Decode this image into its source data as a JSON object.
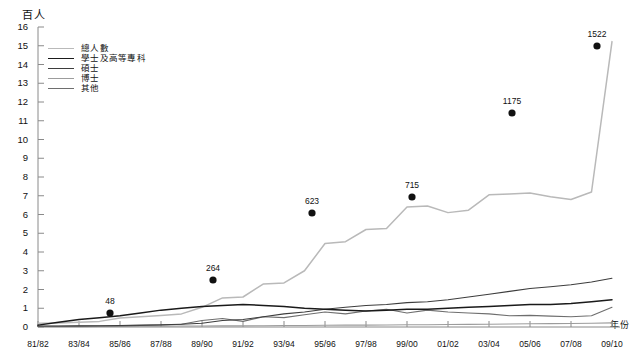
{
  "axes": {
    "y_unit_label": "百人",
    "x_axis_title": "年份",
    "y_ticks": [
      "16",
      "15",
      "14",
      "13",
      "12",
      "11",
      "10",
      "9",
      "8",
      "7",
      "6",
      "5",
      "4",
      "3",
      "2",
      "1",
      "0"
    ],
    "x_ticks": [
      "81/82",
      "83/84",
      "85/86",
      "87/88",
      "89/90",
      "91/92",
      "93/94",
      "95/96",
      "97/98",
      "99/00",
      "01/02",
      "03/04",
      "05/06",
      "07/08",
      "09/10"
    ]
  },
  "legend": {
    "items": [
      {
        "label": "總人數",
        "color": "#b9b9b9"
      },
      {
        "label": "學士及高等專科",
        "color": "#1a1a1a"
      },
      {
        "label": "碩士",
        "color": "#3d3d3d"
      },
      {
        "label": "博士",
        "color": "#9c9c9c"
      },
      {
        "label": "其他",
        "color": "#6e6e6e"
      }
    ]
  },
  "annotations": [
    {
      "label": "48",
      "x_px": 110,
      "y_px": 313,
      "dot_x": 110,
      "dot_y": 313
    },
    {
      "label": "264",
      "x_px": 213,
      "y_px": 280,
      "dot_x": 213,
      "dot_y": 280
    },
    {
      "label": "623",
      "x_px": 312,
      "y_px": 213,
      "dot_x": 312,
      "dot_y": 213
    },
    {
      "label": "715",
      "x_px": 412,
      "y_px": 197,
      "dot_x": 412,
      "dot_y": 197
    },
    {
      "label": "1175",
      "x_px": 512,
      "y_px": 113,
      "dot_x": 512,
      "dot_y": 113
    },
    {
      "label": "1522",
      "x_px": 597,
      "y_px": 46,
      "dot_x": 597,
      "dot_y": 46
    }
  ],
  "chart_data": {
    "type": "line",
    "title": "",
    "xlabel": "年份",
    "ylabel": "百人",
    "ylim": [
      0,
      16
    ],
    "grid": false,
    "legend_position": "top-left",
    "x": [
      "81/82",
      "82/83",
      "83/84",
      "84/85",
      "85/86",
      "86/87",
      "87/88",
      "88/89",
      "89/90",
      "90/91",
      "91/92",
      "92/93",
      "93/94",
      "94/95",
      "95/96",
      "96/97",
      "97/98",
      "98/99",
      "99/00",
      "00/01",
      "01/02",
      "02/03",
      "03/04",
      "04/05",
      "05/06",
      "06/07",
      "07/08",
      "08/09",
      "09/10"
    ],
    "series": [
      {
        "name": "總人數",
        "color": "#b9b9b9",
        "values": [
          0.2,
          0.22,
          0.25,
          0.3,
          0.48,
          0.55,
          0.62,
          0.7,
          1.05,
          1.55,
          1.6,
          2.3,
          2.35,
          3.0,
          4.45,
          4.55,
          5.2,
          5.25,
          6.4,
          6.45,
          6.1,
          6.23,
          7.05,
          7.1,
          7.15,
          6.95,
          6.8,
          7.2,
          15.22
        ]
      },
      {
        "name": "學士及高等專科",
        "color": "#1a1a1a",
        "values": [
          0.1,
          0.25,
          0.4,
          0.5,
          0.6,
          0.75,
          0.9,
          1.0,
          1.1,
          1.15,
          1.2,
          1.15,
          1.1,
          1.0,
          0.95,
          0.9,
          0.85,
          0.9,
          0.95,
          0.95,
          1.0,
          1.05,
          1.1,
          1.15,
          1.2,
          1.2,
          1.25,
          1.35,
          1.45
        ]
      },
      {
        "name": "碩士",
        "color": "#3d3d3d",
        "values": [
          0.05,
          0.05,
          0.06,
          0.07,
          0.08,
          0.1,
          0.12,
          0.15,
          0.2,
          0.35,
          0.4,
          0.55,
          0.7,
          0.8,
          0.95,
          1.05,
          1.15,
          1.2,
          1.3,
          1.35,
          1.45,
          1.6,
          1.75,
          1.9,
          2.05,
          2.15,
          2.25,
          2.4,
          2.6
        ]
      },
      {
        "name": "博士",
        "color": "#9c9c9c",
        "values": [
          0.02,
          0.02,
          0.02,
          0.03,
          0.03,
          0.04,
          0.04,
          0.05,
          0.05,
          0.06,
          0.06,
          0.07,
          0.08,
          0.08,
          0.09,
          0.1,
          0.1,
          0.11,
          0.12,
          0.12,
          0.13,
          0.14,
          0.15,
          0.16,
          0.17,
          0.18,
          0.19,
          0.2,
          0.22
        ]
      },
      {
        "name": "其他",
        "color": "#6e6e6e",
        "values": [
          0.04,
          0.04,
          0.05,
          0.05,
          0.06,
          0.08,
          0.1,
          0.15,
          0.35,
          0.45,
          0.3,
          0.55,
          0.5,
          0.65,
          0.8,
          0.7,
          0.85,
          0.95,
          0.75,
          0.9,
          0.8,
          0.75,
          0.7,
          0.6,
          0.62,
          0.58,
          0.55,
          0.6,
          1.05
        ]
      }
    ]
  }
}
